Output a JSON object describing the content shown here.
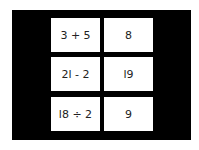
{
  "game": {
    "colors": {
      "board": "#000000",
      "card": "#ffffff",
      "text": "#222222"
    },
    "rows": [
      {
        "expression": "3 + 5",
        "answer": "8"
      },
      {
        "expression": "2l - 2",
        "answer": "l9"
      },
      {
        "expression": "l8 ÷ 2",
        "answer": "9"
      }
    ]
  }
}
